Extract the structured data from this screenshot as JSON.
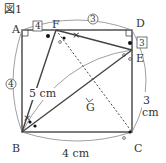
{
  "figure": {
    "title": "図1",
    "points": {
      "A": "A",
      "B": "B",
      "C": "C",
      "D": "D",
      "E": "E",
      "F": "F",
      "G": "G"
    },
    "lengths": {
      "BF": "5 cm",
      "BC": "4 cm",
      "CE": "3 cm",
      "AF_box": "4",
      "FD_circle": "3",
      "DE_box": "3",
      "AB_circle": "4"
    }
  }
}
